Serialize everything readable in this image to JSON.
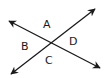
{
  "diagram": {
    "type": "intersecting-lines",
    "line_color": "#1a1a1a",
    "lines": [
      {
        "name": "line-1",
        "from": [
          9,
          21
        ],
        "to": [
          100,
          68
        ]
      },
      {
        "name": "line-2",
        "from": [
          11,
          74
        ],
        "to": [
          95,
          9
        ]
      }
    ],
    "labels": {
      "a": "A",
      "b": "B",
      "c": "C",
      "d": "D"
    }
  }
}
